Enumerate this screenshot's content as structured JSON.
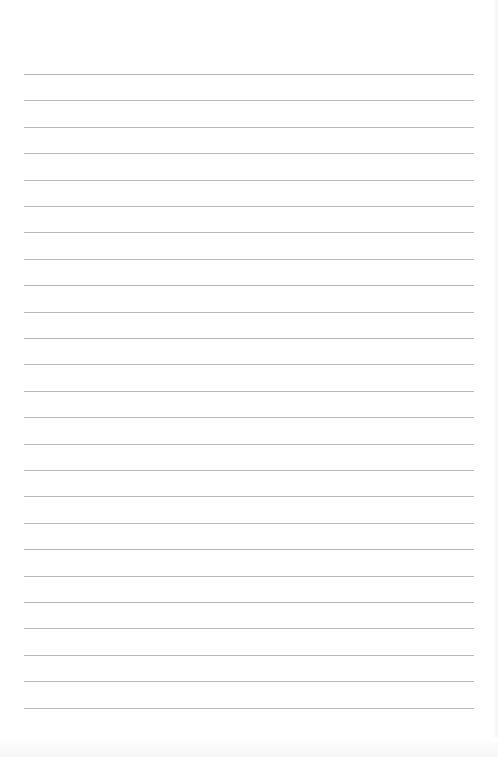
{
  "page": {
    "type": "lined-paper",
    "background_color": "#ffffff",
    "rule_color": "#b9b9b9",
    "rule_count": 25,
    "first_rule_y": 74,
    "rule_spacing": 26.4,
    "rule_left": 24,
    "rule_right": 474
  }
}
